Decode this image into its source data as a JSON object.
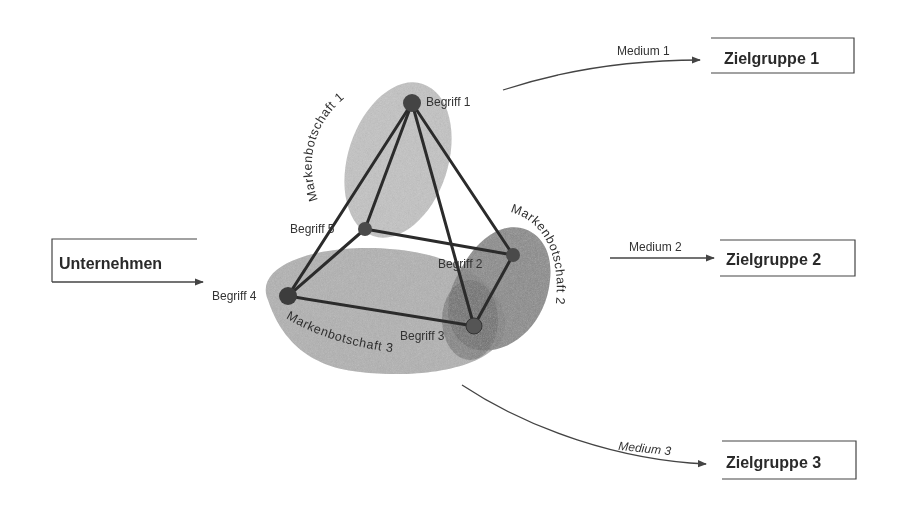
{
  "diagram": {
    "source": {
      "label": "Unternehmen"
    },
    "nodes": [
      {
        "id": "begriff-1",
        "label": "Begriff 1"
      },
      {
        "id": "begriff-2",
        "label": "Begriff 2"
      },
      {
        "id": "begriff-3",
        "label": "Begriff 3"
      },
      {
        "id": "begriff-4",
        "label": "Begriff 4"
      },
      {
        "id": "begriff-5",
        "label": "Begriff 5"
      }
    ],
    "messages": [
      {
        "label": "Markenbotschaft 1",
        "color": "#b8b8b8"
      },
      {
        "label": "Markenbotschaft 2",
        "color": "#7a7a7a"
      },
      {
        "label": "Markenbotschaft 3",
        "color": "#a8a8a8"
      }
    ],
    "media": [
      {
        "label": "Medium 1"
      },
      {
        "label": "Medium 2"
      },
      {
        "label": "Medium 3"
      }
    ],
    "targets": [
      {
        "label": "Zielgruppe 1"
      },
      {
        "label": "Zielgruppe 2"
      },
      {
        "label": "Zielgruppe 3"
      }
    ],
    "edges": [
      [
        "begriff-1",
        "begriff-4"
      ],
      [
        "begriff-1",
        "begriff-5"
      ],
      [
        "begriff-1",
        "begriff-3"
      ],
      [
        "begriff-1",
        "begriff-2"
      ],
      [
        "begriff-5",
        "begriff-2"
      ],
      [
        "begriff-5",
        "begriff-4"
      ],
      [
        "begriff-4",
        "begriff-3"
      ],
      [
        "begriff-2",
        "begriff-3"
      ]
    ]
  }
}
